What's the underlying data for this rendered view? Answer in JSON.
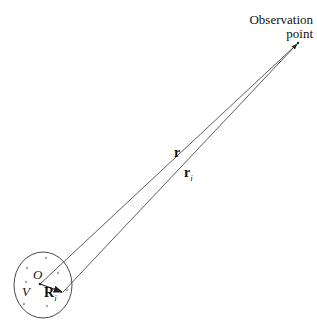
{
  "diagram": {
    "observation_label_line1": "Observation",
    "observation_label_line2": "point",
    "vector_r_label": "r",
    "vector_ri_label": "r",
    "vector_ri_subscript": "i",
    "origin_label": "O",
    "volume_label": "V",
    "position_vector_label": "R",
    "position_vector_subscript": "i",
    "colors": {
      "stroke": "#222222",
      "dots": "#999999",
      "text": "#111111"
    }
  }
}
